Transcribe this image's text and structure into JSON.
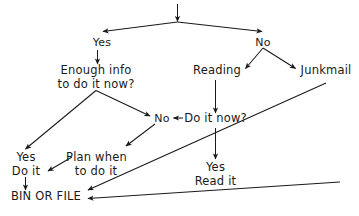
{
  "diagram": {
    "ink_color": "#1a1a1a",
    "background_color": "#ffffff",
    "nodes": [
      {
        "id": "yes-top",
        "label": "Yes",
        "x": 101,
        "y": 36
      },
      {
        "id": "no-top",
        "label": "No",
        "x": 263,
        "y": 36
      },
      {
        "id": "enough-info",
        "label": "Enough info\nto do it now?",
        "x": 96,
        "y": 64
      },
      {
        "id": "reading",
        "label": "Reading",
        "x": 217,
        "y": 64
      },
      {
        "id": "junkmail",
        "label": "Junkmail",
        "x": 325,
        "y": 64
      },
      {
        "id": "no-mid",
        "label": "No",
        "x": 162,
        "y": 112
      },
      {
        "id": "do-it-now",
        "label": "Do it now?",
        "x": 214,
        "y": 112
      },
      {
        "id": "yes-do-it",
        "label": "Yes\nDo it",
        "x": 26,
        "y": 151
      },
      {
        "id": "plan-when",
        "label": "Plan when\nto do it",
        "x": 95,
        "y": 151
      },
      {
        "id": "yes-read-it",
        "label": "Yes\nRead it",
        "x": 215,
        "y": 161
      },
      {
        "id": "bin-or-file",
        "label": "BIN OR FILE",
        "x": 45,
        "y": 190
      }
    ],
    "edges": [
      {
        "id": "edge-inbox-in",
        "from": "inbox",
        "to": "split-top",
        "kind": "arrow"
      },
      {
        "id": "edge-split-yes",
        "from": "split-top",
        "to": "yes-top",
        "kind": "arrow"
      },
      {
        "id": "edge-split-no",
        "from": "split-top",
        "to": "no-top",
        "kind": "arrow"
      },
      {
        "id": "edge-yes-enough-info",
        "from": "yes-top",
        "to": "enough-info",
        "kind": "arrow"
      },
      {
        "id": "edge-no-reading",
        "from": "no-top",
        "to": "reading",
        "kind": "arrow"
      },
      {
        "id": "edge-no-junkmail",
        "from": "no-top",
        "to": "junkmail",
        "kind": "arrow"
      },
      {
        "id": "edge-reading-do-it-now",
        "from": "reading",
        "to": "do-it-now",
        "kind": "arrow"
      },
      {
        "id": "edge-do-it-now-no",
        "from": "do-it-now",
        "to": "no-mid",
        "kind": "arrow"
      },
      {
        "id": "edge-enough-info-yes",
        "from": "enough-info",
        "to": "yes-do-it",
        "kind": "arrow"
      },
      {
        "id": "edge-enough-info-no",
        "from": "enough-info",
        "to": "no-mid",
        "kind": "arrow"
      },
      {
        "id": "edge-no-mid-plan",
        "from": "no-mid",
        "to": "plan-when",
        "kind": "arrow"
      },
      {
        "id": "edge-do-it-now-yes",
        "from": "do-it-now",
        "to": "yes-read-it",
        "kind": "arrow"
      },
      {
        "id": "edge-do-it-bin",
        "from": "yes-do-it",
        "to": "bin-or-file",
        "kind": "arrow"
      },
      {
        "id": "edge-plan-bin",
        "from": "plan-when",
        "to": "bin-or-file",
        "kind": "arrow"
      },
      {
        "id": "edge-junkmail-bin",
        "from": "junkmail",
        "to": "bin-or-file",
        "kind": "arrow"
      },
      {
        "id": "edge-read-it-bin",
        "from": "yes-read-it",
        "to": "bin-or-file",
        "kind": "arrow"
      }
    ]
  }
}
